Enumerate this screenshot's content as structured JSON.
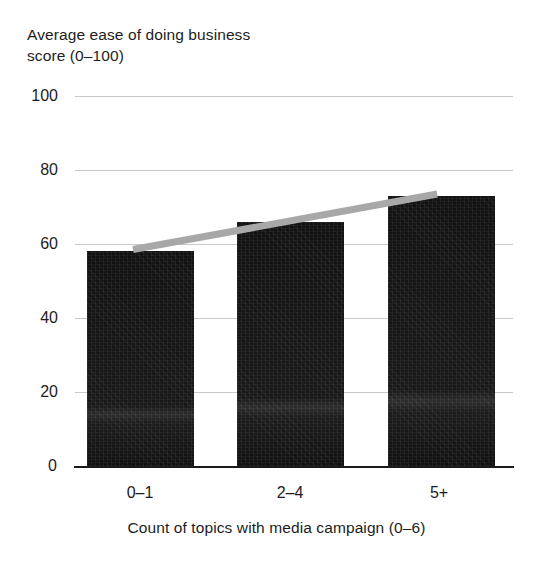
{
  "chart_data": {
    "type": "bar",
    "title": "Average ease of doing business\nscore (0–100)",
    "ylabel": "Average ease of doing business score (0–100)",
    "xlabel": "Count of topics with media campaign (0–6)",
    "categories": [
      "0–1",
      "2–4",
      "5+"
    ],
    "values": [
      58,
      66,
      73
    ],
    "series": [
      {
        "name": "Average ease of doing business score",
        "values": [
          58,
          66,
          73
        ],
        "color": "#131313"
      }
    ],
    "trendline": {
      "name": "linear trend",
      "color": "#a8a8a8",
      "x": [
        "0–1",
        "2–4",
        "5+"
      ],
      "y": [
        58.5,
        65.5,
        73.5
      ]
    },
    "ylim": [
      0,
      100
    ],
    "yticks": [
      0,
      20,
      40,
      60,
      80,
      100
    ],
    "ytick_labels": [
      "0",
      "20",
      "40",
      "60",
      "80",
      "100"
    ],
    "grid": true,
    "legend": "none"
  }
}
